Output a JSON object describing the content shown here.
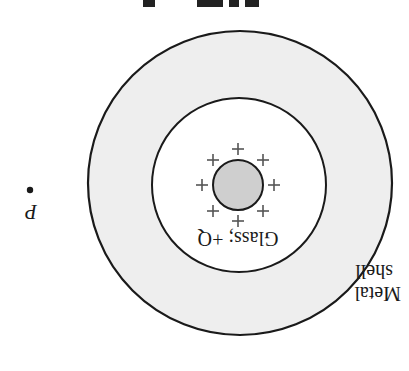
{
  "figure": {
    "orientation": "rotated 180 degrees",
    "caption_partial": "",
    "labels": {
      "glass": "Glass; +Q",
      "metal_line1": "Metal",
      "metal_line2": "shell",
      "point": "P"
    },
    "colors": {
      "shell_fill": "#eeeeee",
      "cavity_fill": "#ffffff",
      "glass_fill": "#cfcfcf",
      "stroke": "#1a1a1a",
      "charge": "#555555"
    },
    "charge_symbol": "+",
    "charge_count": 8
  }
}
